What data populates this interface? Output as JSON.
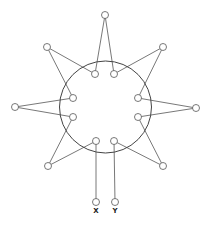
{
  "diagram": {
    "ring": {
      "cx": 105.5,
      "cy": 107,
      "r": 46
    },
    "node_radius": 3.5,
    "inner_nodes": [
      {
        "id": "i1",
        "x": 95,
        "y": 74
      },
      {
        "id": "i2",
        "x": 114,
        "y": 74
      },
      {
        "id": "i3",
        "x": 138,
        "y": 98
      },
      {
        "id": "i4",
        "x": 138,
        "y": 117
      },
      {
        "id": "i5",
        "x": 114,
        "y": 141
      },
      {
        "id": "i6",
        "x": 96,
        "y": 141
      },
      {
        "id": "i7",
        "x": 73,
        "y": 117
      },
      {
        "id": "i8",
        "x": 73,
        "y": 98
      }
    ],
    "outer_nodes": [
      {
        "id": "o-top",
        "x": 105,
        "y": 15
      },
      {
        "id": "o-upper-right",
        "x": 163,
        "y": 47
      },
      {
        "id": "o-right",
        "x": 196,
        "y": 108
      },
      {
        "id": "o-lower-right",
        "x": 163,
        "y": 166
      },
      {
        "id": "o-y",
        "x": 115,
        "y": 202,
        "label": "Y"
      },
      {
        "id": "o-x",
        "x": 96,
        "y": 202,
        "label": "X"
      },
      {
        "id": "o-lower-left",
        "x": 48,
        "y": 166
      },
      {
        "id": "o-left",
        "x": 15,
        "y": 107
      },
      {
        "id": "o-upper-left",
        "x": 47,
        "y": 47
      }
    ],
    "edges": [
      [
        "o-top",
        "i1"
      ],
      [
        "o-top",
        "i2"
      ],
      [
        "o-upper-right",
        "i2"
      ],
      [
        "o-upper-right",
        "i3"
      ],
      [
        "o-right",
        "i3"
      ],
      [
        "o-right",
        "i4"
      ],
      [
        "o-lower-right",
        "i4"
      ],
      [
        "o-lower-right",
        "i5"
      ],
      [
        "o-y",
        "i5"
      ],
      [
        "o-x",
        "i6"
      ],
      [
        "o-lower-left",
        "i6"
      ],
      [
        "o-lower-left",
        "i7"
      ],
      [
        "o-left",
        "i7"
      ],
      [
        "o-left",
        "i8"
      ],
      [
        "o-upper-left",
        "i8"
      ],
      [
        "o-upper-left",
        "i1"
      ]
    ],
    "labels": {
      "x": "X",
      "y": "Y"
    }
  }
}
